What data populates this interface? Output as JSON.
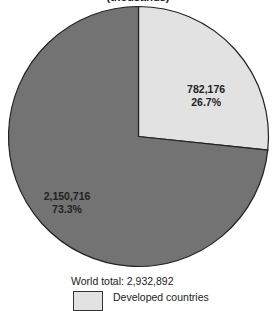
{
  "chart_data": {
    "type": "pie",
    "title": "",
    "subtitle": "(thousands)",
    "total_label": "World total:  2,932,892",
    "slices": [
      {
        "name": "Developed countries",
        "value": 782176,
        "value_label": "782,176",
        "percent_label": "26.7%",
        "color": "#e2e2e2"
      },
      {
        "name": "Developing countries",
        "value": 2150716,
        "value_label": "2,150,716",
        "percent_label": "73.3%",
        "color": "#737373"
      }
    ],
    "start": "top",
    "direction": "clockwise",
    "legend": [
      {
        "label": "Developed countries",
        "color": "#e2e2e2"
      }
    ],
    "legend_position": "bottom"
  }
}
